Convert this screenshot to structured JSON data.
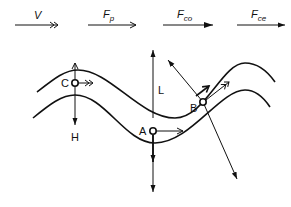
{
  "legend": [
    {
      "symbol": "V",
      "sub": "",
      "head": "double-chevron"
    },
    {
      "symbol": "F",
      "sub": "p",
      "head": "open"
    },
    {
      "symbol": "F",
      "sub": "co",
      "head": "filled-large"
    },
    {
      "symbol": "F",
      "sub": "ce",
      "head": "filled-small"
    }
  ],
  "points": {
    "A": "A",
    "B": "B",
    "C": "C"
  },
  "axes": {
    "lift": "L",
    "horizontal": "H"
  },
  "colors": {
    "stroke": "#111111",
    "background": "#ffffff"
  }
}
